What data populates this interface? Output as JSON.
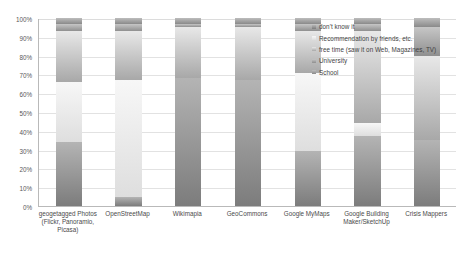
{
  "chart_data": {
    "type": "bar",
    "subtype": "stacked-percentage",
    "title": "",
    "xlabel": "",
    "ylabel": "",
    "ylim": [
      0,
      100
    ],
    "ytick_labels": [
      "100%",
      "90%",
      "80%",
      "70%",
      "60%",
      "50%",
      "40%",
      "30%",
      "20%",
      "10%",
      "0%"
    ],
    "ytick_values": [
      100,
      90,
      80,
      70,
      60,
      50,
      40,
      30,
      20,
      10,
      0
    ],
    "grid": true,
    "legend_position": "top-right",
    "categories": [
      "geogetagged Photos (Flickr, Panoramio, Picasa)",
      "OpenStreetMap",
      "Wikimapia",
      "GeoCommons",
      "Google MyMaps",
      "Google Building Maker/SketchUp",
      "Crisis Mappers"
    ],
    "series": [
      {
        "name": "don't know it",
        "color": "#9a9a9a",
        "color_top": "#b4b4b4",
        "color_bottom": "#7c7c7c",
        "values": [
          34,
          5,
          68,
          67,
          29,
          37,
          35
        ]
      },
      {
        "name": "Recommendation by friends, etc.",
        "color": "#ededed",
        "color_top": "#f7f7f7",
        "color_bottom": "#dedede",
        "values": [
          32,
          62,
          0,
          0,
          42,
          7,
          0
        ]
      },
      {
        "name": "free time (saw it on Web, Magazines, TV)",
        "color": "#cfcfcf",
        "color_top": "#e8e8e8",
        "color_bottom": "#a8a8a8",
        "values": [
          27,
          26,
          27,
          28,
          22,
          49,
          45
        ]
      },
      {
        "name": "University",
        "color": "#b0b0b0",
        "color_top": "#c6c6c6",
        "color_bottom": "#8f8f8f",
        "values": [
          4,
          4,
          2,
          2,
          4,
          4,
          15
        ]
      },
      {
        "name": "School",
        "color": "#a3a3a3",
        "color_top": "#bdbdbd",
        "color_bottom": "#8a8a8a",
        "values": [
          3,
          3,
          3,
          3,
          3,
          3,
          5
        ]
      }
    ]
  }
}
